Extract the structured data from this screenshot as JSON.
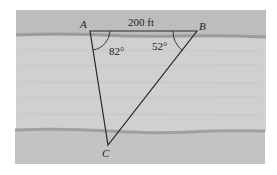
{
  "figure": {
    "labels": {
      "vertex_a": "A",
      "vertex_b": "B",
      "vertex_c": "C",
      "side_ab": "200 ft",
      "angle_a": "82°",
      "angle_b": "52°"
    },
    "colors": {
      "background": "#ffffff",
      "top_bank": "#bcbcbc",
      "river": "#cfcfcf",
      "bottom_bank": "#c2c2c2",
      "shoreline": "#9a9a9a",
      "lines": "#2a2a2a"
    }
  }
}
